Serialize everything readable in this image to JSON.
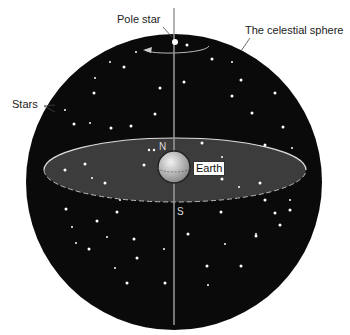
{
  "diagram": {
    "labels": {
      "pole_star": "Pole star",
      "celestial_sphere": "The celestial sphere",
      "stars": "Stars",
      "earth": "Earth",
      "north": "N",
      "south": "S"
    },
    "colors": {
      "sphere": "#0a0a0a",
      "equator_plane": "#3a3a3a",
      "axis": "#9a9a9a",
      "star": "#ffffff",
      "earth": "#b8b8b8"
    }
  }
}
